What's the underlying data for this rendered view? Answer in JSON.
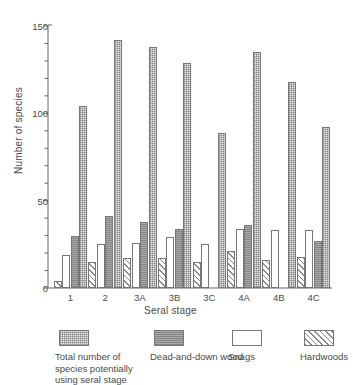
{
  "chart_data": {
    "type": "bar",
    "title": "",
    "xlabel": "Seral stage",
    "ylabel": "Number of species",
    "categories": [
      "1",
      "2",
      "3A",
      "3B",
      "3C",
      "4A",
      "4B",
      "4C"
    ],
    "ylim": [
      0,
      150
    ],
    "yticks": [
      0,
      50,
      100,
      150
    ],
    "ytick_labels": [
      "0",
      "50",
      "100",
      "150"
    ],
    "yminor_interval": 10,
    "grid": false,
    "legend_position": "below",
    "series": [
      {
        "name": "Hardwoods",
        "pattern": "diagonal-hatch",
        "color": "#ffffff",
        "values": [
          4,
          15,
          17,
          17,
          15,
          21,
          16,
          18
        ]
      },
      {
        "name": "Snags",
        "pattern": "white",
        "color": "#ffffff",
        "values": [
          19,
          25,
          26,
          29,
          25,
          34,
          33,
          33
        ]
      },
      {
        "name": "Dead-and-down wood",
        "pattern": "solid-gray",
        "color": "#a9a9a9",
        "values": [
          30,
          41,
          38,
          34,
          0,
          36,
          0,
          27
        ]
      },
      {
        "name": "Total number of species potentially using seral stage",
        "pattern": "fine-stipple",
        "color": "#eeeeee",
        "values": [
          104,
          142,
          138,
          129,
          89,
          135,
          118,
          92
        ]
      }
    ]
  },
  "legend": {
    "items": [
      {
        "label": "Total number of species potentially using seral stage",
        "swatch": "fill-total"
      },
      {
        "label": "Dead-and-down wood",
        "swatch": "fill-dead"
      },
      {
        "label": "Snags",
        "swatch": "fill-snags"
      },
      {
        "label": "Hardwoods",
        "swatch": "fill-hard"
      }
    ]
  }
}
